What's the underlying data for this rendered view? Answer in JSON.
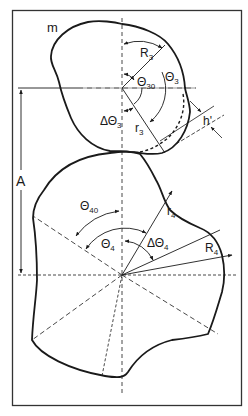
{
  "diagram": {
    "type": "cam-pair-geometry",
    "colors": {
      "background": "#ffffff",
      "stroke": "#1a1a1a",
      "frame": "#333333"
    },
    "upper_cam": {
      "label": "m",
      "radius_max": {
        "symbol": "R",
        "sub": "3"
      },
      "radius_min": {
        "symbol": "r",
        "sub": "3"
      },
      "angle": {
        "symbol": "Θ",
        "sub": "3"
      },
      "angle_initial": {
        "symbol": "Θ",
        "sub": "30"
      },
      "angle_delta": {
        "symbol": "ΔΘ",
        "sub": "3"
      },
      "offset": {
        "symbol": "h'"
      }
    },
    "lower_cam": {
      "radius_max": {
        "symbol": "R",
        "sub": "4"
      },
      "radius_min": {
        "symbol": "r",
        "sub": "4"
      },
      "angle": {
        "symbol": "Θ",
        "sub": "4"
      },
      "angle_initial": {
        "symbol": "Θ",
        "sub": "40"
      },
      "angle_delta": {
        "symbol": "ΔΘ",
        "sub": "4"
      }
    },
    "center_distance": {
      "symbol": "A"
    }
  }
}
